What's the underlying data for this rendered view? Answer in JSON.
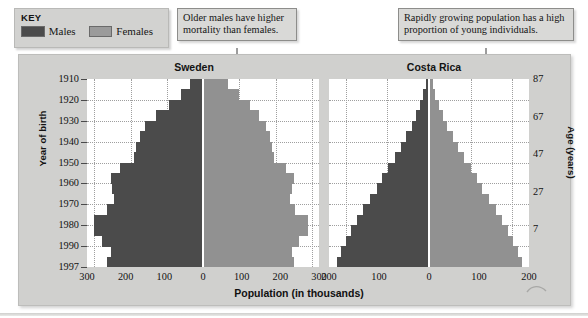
{
  "key": {
    "title": "KEY",
    "items": [
      {
        "label": "Males",
        "color": "#4b4b4b"
      },
      {
        "label": "Females",
        "color": "#919191"
      }
    ]
  },
  "annotations": [
    {
      "id": "mortality",
      "text": "Older males have higher mortality than females."
    },
    {
      "id": "young",
      "text": "Rapidly growing population has a high proportion of young individuals."
    },
    {
      "id": "births",
      "text": "Number of births has been relatively constant over many decades."
    }
  ],
  "axes": {
    "y_left_title": "Year of birth",
    "y_left_ticks": [
      "1910",
      "1920",
      "1930",
      "1940",
      "1950",
      "1960",
      "1970",
      "1980",
      "1990",
      "1997"
    ],
    "y_right_title": "Age (years)",
    "y_right_ticks": [
      "87",
      "67",
      "47",
      "27",
      "7"
    ],
    "x_title": "Population (in thousands)",
    "x_ticks_sweden": [
      "300",
      "200",
      "100",
      "0",
      "100",
      "200",
      "300"
    ],
    "x_ticks_costarica": [
      "200",
      "100",
      "0",
      "100",
      "200"
    ]
  },
  "chart_data": {
    "type": "bar",
    "xlabel": "Population (in thousands)",
    "ylabel": "Year of birth",
    "ylabel_secondary": "Age (years)",
    "grid": true,
    "legend_position": "top-left",
    "orientation": "horizontal-mirrored",
    "year_of_birth_axis": [
      "1910",
      "1920",
      "1930",
      "1940",
      "1950",
      "1960",
      "1970",
      "1980",
      "1990",
      "1997"
    ],
    "age_axis": [
      "87",
      "67",
      "47",
      "27",
      "7"
    ],
    "panels": [
      {
        "name": "Sweden",
        "xlim": [
          0,
          320
        ],
        "xticks": [
          300,
          200,
          100,
          0,
          100,
          200,
          300
        ],
        "age_groups": [
          "85+",
          "80-84",
          "75-79",
          "70-74",
          "65-69",
          "60-64",
          "55-59",
          "50-54",
          "45-49",
          "40-44",
          "35-39",
          "30-34",
          "25-29",
          "20-24",
          "15-19",
          "10-14",
          "5-9",
          "0-4"
        ],
        "series": [
          {
            "name": "Males",
            "color": "#4b4b4b",
            "values": [
              35,
              60,
              95,
              130,
              160,
              175,
              185,
              190,
              230,
              255,
              250,
              245,
              265,
              300,
              300,
              280,
              255,
              265
            ]
          },
          {
            "name": "Females",
            "color": "#919191",
            "values": [
              70,
              100,
              130,
              155,
              175,
              185,
              190,
              195,
              230,
              250,
              245,
              240,
              255,
              290,
              290,
              265,
              245,
              250
            ]
          }
        ]
      },
      {
        "name": "Costa Rica",
        "xlim": [
          0,
          240
        ],
        "xticks": [
          200,
          100,
          0,
          100,
          200
        ],
        "age_groups": [
          "85+",
          "80-84",
          "75-79",
          "70-74",
          "65-69",
          "60-64",
          "55-59",
          "50-54",
          "45-49",
          "40-44",
          "35-39",
          "30-34",
          "25-29",
          "20-24",
          "15-19",
          "10-14",
          "5-9",
          "0-4"
        ],
        "series": [
          {
            "name": "Males",
            "color": "#4b4b4b",
            "values": [
              8,
              14,
              22,
              32,
              42,
              55,
              68,
              82,
              98,
              112,
              126,
              142,
              158,
              172,
              188,
              200,
              212,
              220
            ]
          },
          {
            "name": "Females",
            "color": "#919191",
            "values": [
              9,
              15,
              24,
              34,
              44,
              57,
              70,
              84,
              100,
              114,
              128,
              144,
              160,
              174,
              190,
              202,
              214,
              222
            ]
          }
        ]
      }
    ]
  }
}
